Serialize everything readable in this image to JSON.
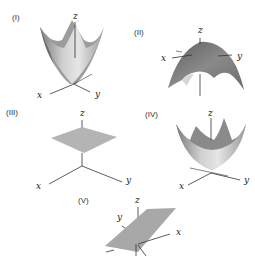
{
  "figure": {
    "panels": [
      {
        "id": "I",
        "label": "(I)",
        "surface": "upward paraboloid",
        "axes": {
          "x": "x",
          "y": "y",
          "z": "z"
        }
      },
      {
        "id": "II",
        "label": "(II)",
        "surface": "downward paraboloid",
        "axes": {
          "x": "x",
          "y": "y",
          "z": "z"
        }
      },
      {
        "id": "III",
        "label": "(III)",
        "surface": "horizontal plane",
        "axes": {
          "x": "x",
          "y": "y",
          "z": "z"
        }
      },
      {
        "id": "IV",
        "label": "(IV)",
        "surface": "upward paraboloid",
        "axes": {
          "x": "x",
          "y": "y",
          "z": "z"
        }
      },
      {
        "id": "V",
        "label": "(V)",
        "surface": "tilted plane",
        "axes": {
          "x": "x",
          "y": "y",
          "z": "z"
        }
      }
    ],
    "colors": {
      "surface_light": "#d8d8d8",
      "surface_mid": "#a9a9a9",
      "surface_dark": "#6f6f6f",
      "axis": "#333333"
    }
  }
}
